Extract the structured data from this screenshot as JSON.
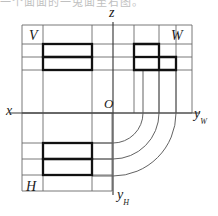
{
  "page": {
    "width": 218,
    "height": 216,
    "background": "#ffffff",
    "cut_off_top_text": "一个面面的一兔面至右图。"
  },
  "figure": {
    "kind": "orthographic-three-view-projection",
    "line_color": "#1a1a1a",
    "thin_line_color": "#595959",
    "thick_stroke_width": 2.2,
    "thin_stroke_width": 0.9
  },
  "axes": {
    "origin_label": "O",
    "origin_point": {
      "x": 113,
      "y": 113
    },
    "vertical_axis": {
      "label": "z",
      "x": 113,
      "y_top": 22,
      "y_bottom": 195
    },
    "horizontal_axis": {
      "label": "x",
      "y": 113,
      "x_left": 10,
      "x_right": 200
    },
    "right_axis_label": "y",
    "right_axis_subscript": "W",
    "bottom_axis_label": "y",
    "bottom_axis_subscript": "H"
  },
  "views": {
    "front": {
      "name": "V",
      "label": "V",
      "label_pos": {
        "x": 31,
        "y": 35
      },
      "frame": {
        "x": 22,
        "y": 25,
        "width": 170,
        "height": 88
      },
      "shape_type": "two-stacked-rectangles",
      "rects": [
        {
          "x": 43,
          "y": 44,
          "width": 49,
          "height": 13
        },
        {
          "x": 43,
          "y": 57,
          "width": 49,
          "height": 13
        }
      ]
    },
    "side": {
      "name": "W",
      "label": "W",
      "label_pos": {
        "x": 173,
        "y": 35
      },
      "shape_type": "stepped-L-shape",
      "outline": [
        {
          "x": 134,
          "y": 44
        },
        {
          "x": 159,
          "y": 44
        },
        {
          "x": 159,
          "y": 57
        },
        {
          "x": 176,
          "y": 57
        },
        {
          "x": 176,
          "y": 70
        },
        {
          "x": 134,
          "y": 70
        }
      ],
      "inner_step_line": {
        "x1": 134,
        "y1": 57,
        "x2": 159,
        "y2": 57
      },
      "inner_vertical_line": {
        "x1": 159,
        "y1": 57,
        "x2": 159,
        "y2": 70
      }
    },
    "top": {
      "name": "H",
      "label": "H",
      "label_pos": {
        "x": 28,
        "y": 186
      },
      "frame": {
        "x": 22,
        "y": 113,
        "width": 90,
        "height": 78
      },
      "shape_type": "two-stacked-rectangles",
      "rects": [
        {
          "x": 43,
          "y": 143,
          "width": 49,
          "height": 16
        },
        {
          "x": 43,
          "y": 159,
          "width": 49,
          "height": 16
        }
      ]
    }
  },
  "projection_arcs": {
    "description": "quarter-circle arcs centered at origin linking top view to side view",
    "center": {
      "x": 113,
      "y": 113
    },
    "radii": [
      30,
      46,
      63
    ],
    "count": 3
  },
  "thin_construction_lines": {
    "vertical_x_positions": [
      43,
      92,
      134,
      159,
      176
    ],
    "horizontal_y_positions": [
      44,
      57,
      70,
      143,
      159,
      175
    ]
  }
}
